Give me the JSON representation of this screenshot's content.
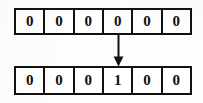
{
  "diagram": {
    "type": "bit-array-transition",
    "arrays": [
      {
        "name": "top-array",
        "cells": [
          "0",
          "0",
          "0",
          "0",
          "0",
          "0"
        ]
      },
      {
        "name": "bottom-array",
        "cells": [
          "0",
          "0",
          "0",
          "1",
          "0",
          "0"
        ]
      }
    ],
    "arrow": {
      "name": "down-arrow-icon",
      "direction": "down",
      "from_cell_index": 3,
      "to_cell_index": 3
    },
    "colors": {
      "ink": "#111111",
      "paper": "#fdfdfc",
      "cell_fill": "#ffffff"
    }
  }
}
